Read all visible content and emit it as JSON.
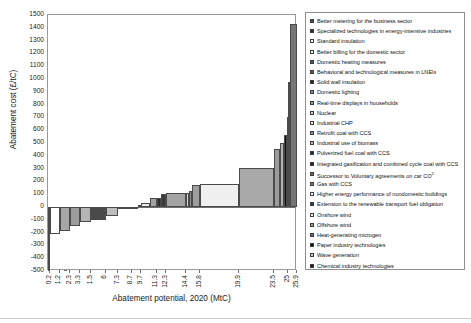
{
  "chart_data": {
    "type": "bar",
    "subtype": "waterfall-marginal-abatement-cost-curve",
    "title": "",
    "xlabel": "Abatement potential, 2020 (MtC)",
    "ylabel": "Abatement cost (£/tC)",
    "ylim": [
      -500,
      1500
    ],
    "ytick_step": 100,
    "yticks": [
      "1500",
      "1400",
      "1300",
      "1200",
      "1100",
      "1000",
      "900",
      "800",
      "700",
      "600",
      "500",
      "400",
      "300",
      "200",
      "100",
      "0",
      "-100",
      "-200",
      "-300",
      "-400",
      "-500"
    ],
    "xlim": [
      0,
      25.9
    ],
    "xtick_labels": [
      "0.2",
      "1.2",
      "2.3",
      "3.3",
      "1.5",
      "6",
      "7.3",
      "8.7",
      "9.7",
      "11.3",
      "12.3",
      "14.4",
      "15.8",
      "19.9",
      "23.5",
      "25",
      "25.9"
    ],
    "grid": false,
    "legend_position": "right-outside",
    "categories": [
      "Better metering for the business sector",
      "Specialized technologies in energy-intensive industries",
      "Standard insulation",
      "Better billing for the domestic sector",
      "Domestic heating measures",
      "Behavioral and technological measures in LNEIs",
      "Solid wall insulation",
      "Domestic lighting",
      "Real-time displays in households",
      "Nuclear",
      "Industrial CHP",
      "Retrofit coal with CCS",
      "Industrial use of biomass",
      "Pulverized fuel coal with CCS",
      "Integrated gasification and combined cycle coal with CCS",
      "Successor to Voluntary agreements on car CO2",
      "Gas with CCS",
      "Higher energy performance of nondomestic buildings",
      "Extension to the renewable transport fuel obligation",
      "Onshore wind",
      "Offshore wind",
      "Heat-generating microgen",
      "Paper industry technologies",
      "Wave generation",
      "Chemical industry technologies",
      "Electricity-generating microgen"
    ],
    "series": [
      {
        "name": "Abatement cost by measure",
        "bars": [
          {
            "label": "Better metering for the business sector",
            "x_start": 0.0,
            "x_end": 0.2,
            "cost": -500,
            "fill": "#4c4c4c"
          },
          {
            "label": "Specialized technologies in energy-intensive industries",
            "x_start": 0.2,
            "x_end": 1.2,
            "cost": -212,
            "fill": "#ffffff"
          },
          {
            "label": "Standard insulation",
            "x_start": 1.2,
            "x_end": 2.3,
            "cost": -186,
            "fill": "#a6a6a6"
          },
          {
            "label": "Better billing for the domestic sector",
            "x_start": 2.3,
            "x_end": 3.3,
            "cost": -145,
            "fill": "#9c9c9c"
          },
          {
            "label": "Domestic heating measures",
            "x_start": 3.3,
            "x_end": 4.5,
            "cost": -120,
            "fill": "#b5b5b5"
          },
          {
            "label": "Behavioral and technological measures in LNEIs",
            "x_start": 4.5,
            "x_end": 6.0,
            "cost": -104,
            "fill": "#4a4a4a"
          },
          {
            "label": "Solid wall insulation",
            "x_start": 6.0,
            "x_end": 7.3,
            "cost": -72,
            "fill": "#bdbdbd"
          },
          {
            "label": "Domestic lighting",
            "x_start": 7.3,
            "x_end": 8.7,
            "cost": -16,
            "fill": "#cfcfcf"
          },
          {
            "label": "Real-time displays in households",
            "x_start": 8.7,
            "x_end": 9.4,
            "cost": -6,
            "fill": "#bcbcbc"
          },
          {
            "label": "Nuclear",
            "x_start": 9.4,
            "x_end": 9.7,
            "cost": 16,
            "fill": "#bdbdbd"
          },
          {
            "label": "Industrial CHP",
            "x_start": 9.7,
            "x_end": 10.6,
            "cost": 32,
            "fill": "#e8e8e8"
          },
          {
            "label": "Retrofit coal with CCS",
            "x_start": 10.6,
            "x_end": 11.3,
            "cost": 71,
            "fill": "#a2a2a2"
          },
          {
            "label": "Industrial use of biomass",
            "x_start": 11.3,
            "x_end": 11.8,
            "cost": 72,
            "fill": "#2c2c2c"
          },
          {
            "label": "Pulverized fuel coal with CCS",
            "x_start": 11.8,
            "x_end": 12.3,
            "cost": 104,
            "fill": "#3a3a3a"
          },
          {
            "label": "Integrated gasification and combined cycle coal with CCS",
            "x_start": 12.3,
            "x_end": 14.4,
            "cost": 106,
            "fill": "#a4a4a4"
          },
          {
            "label": "Successor to Voluntary agreements on car CO2",
            "x_start": 14.4,
            "x_end": 14.7,
            "cost": 112,
            "fill": "#d8d8d8"
          },
          {
            "label": "Gas with CCS",
            "x_start": 14.7,
            "x_end": 15.0,
            "cost": 127,
            "fill": "#8e8e8e"
          },
          {
            "label": "Higher energy performance of nondomestic buildings",
            "x_start": 15.0,
            "x_end": 15.8,
            "cost": 172,
            "fill": "#9e9e9e"
          },
          {
            "label": "Extension to the renewable transport fuel obligation",
            "x_start": 15.8,
            "x_end": 19.9,
            "cost": 176,
            "fill": "#f0f0f0"
          },
          {
            "label": "Onshore wind",
            "x_start": 19.9,
            "x_end": 23.5,
            "cost": 303,
            "fill": "#a9a9a9"
          },
          {
            "label": "Offshore wind",
            "x_start": 23.5,
            "x_end": 24.1,
            "cost": 452,
            "fill": "#9b9b9b"
          },
          {
            "label": "Heat-generating microgen",
            "x_start": 24.1,
            "x_end": 24.5,
            "cost": 502,
            "fill": "#b0b0b0"
          },
          {
            "label": "Paper industry technologies",
            "x_start": 24.5,
            "x_end": 24.9,
            "cost": 560,
            "fill": "#101010"
          },
          {
            "label": "Wave generation",
            "x_start": 24.9,
            "x_end": 25.0,
            "cost": 700,
            "fill": "#c4c4c4"
          },
          {
            "label": "Chemical industry technologies",
            "x_start": 25.0,
            "x_end": 25.2,
            "cost": 980,
            "fill": "#1c1c1c"
          },
          {
            "label": "Electricity-generating microgen",
            "x_start": 25.2,
            "x_end": 25.9,
            "cost": 1430,
            "fill": "#757575"
          }
        ]
      }
    ]
  },
  "legend": {
    "items": [
      {
        "label": "Better metering for the business sector",
        "swatch": "#4c4c4c"
      },
      {
        "label": "Specialized technologies in energy-intensive industries",
        "swatch": "#2e2e2e"
      },
      {
        "label": "Standard insulation",
        "swatch": "#ffffff"
      },
      {
        "label": "Better billing for the domestic sector",
        "swatch": "#f2f2f2"
      },
      {
        "label": "Domestic heating measures",
        "swatch": "#555555"
      },
      {
        "label": "Behavioral and technological measures in LNEIs",
        "swatch": "#5e5e5e"
      },
      {
        "label": "Solid wall insulation",
        "swatch": "#262626"
      },
      {
        "label": "Domestic lighting",
        "swatch": "#8a8a8a"
      },
      {
        "label": "Real-time displays in households",
        "swatch": "#9d9d9d"
      },
      {
        "label": "Nuclear",
        "swatch": "#d0d0d0"
      },
      {
        "label": "Industrial CHP",
        "swatch": "#e4e4e4"
      },
      {
        "label": "Retrofit coal with CCS",
        "swatch": "#8f8f8f"
      },
      {
        "label": "Industrial use of biomass",
        "swatch": "#bdbdbd"
      },
      {
        "label": "Pulverized fuel coal with CCS",
        "swatch": "#262626"
      },
      {
        "label": "Integrated gasification and combined cycle coal with CCS",
        "swatch": "#1f1f1f"
      },
      {
        "label": "Successor to Voluntary agreements on car CO2",
        "swatch": "#6a6a6a"
      },
      {
        "label": "Gas with CCS",
        "swatch": "#7d7d7d"
      },
      {
        "label": "Higher energy performance of nondomestic buildings",
        "swatch": "#f4f4f4"
      },
      {
        "label": "Extension to the renewable transport fuel obligation",
        "swatch": "#333333"
      },
      {
        "label": "Onshore wind",
        "swatch": "#ededed"
      },
      {
        "label": "Offshore wind",
        "swatch": "#9a9a9a"
      },
      {
        "label": "Heat-generating microgen",
        "swatch": "#6f6f6f"
      },
      {
        "label": "Paper industry technologies",
        "swatch": "#101010"
      },
      {
        "label": "Wave generation",
        "swatch": "#c9c9c9"
      },
      {
        "label": "Chemical industry technologies",
        "swatch": "#1a1a1a"
      },
      {
        "label": "Electricity-generating microgen",
        "swatch": "#7a7a7a"
      }
    ],
    "superscript_note": "2"
  }
}
